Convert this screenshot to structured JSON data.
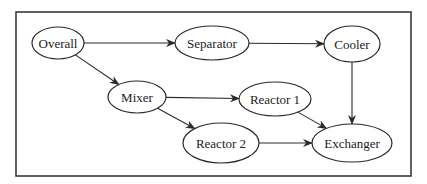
{
  "diagram": {
    "type": "flow-graph",
    "frame": {
      "x": 16,
      "y": 12,
      "width": 395,
      "height": 164
    },
    "nodes": [
      {
        "id": "overall",
        "label": "Overall",
        "cx": 58,
        "cy": 43,
        "rx": 26,
        "ry": 16
      },
      {
        "id": "separator",
        "label": "Separator",
        "cx": 212,
        "cy": 43,
        "rx": 37,
        "ry": 17
      },
      {
        "id": "cooler",
        "label": "Cooler",
        "cx": 352,
        "cy": 44,
        "rx": 28,
        "ry": 18
      },
      {
        "id": "mixer",
        "label": "Mixer",
        "cx": 137,
        "cy": 97,
        "rx": 29,
        "ry": 16
      },
      {
        "id": "reactor1",
        "label": "Reactor 1",
        "cx": 275,
        "cy": 99,
        "rx": 36,
        "ry": 17
      },
      {
        "id": "reactor2",
        "label": "Reactor 2",
        "cx": 221,
        "cy": 143,
        "rx": 38,
        "ry": 20
      },
      {
        "id": "exchanger",
        "label": "Exchanger",
        "cx": 352,
        "cy": 143,
        "rx": 40,
        "ry": 19
      }
    ],
    "edges": [
      {
        "from": "overall",
        "to": "separator"
      },
      {
        "from": "separator",
        "to": "cooler"
      },
      {
        "from": "overall",
        "to": "mixer"
      },
      {
        "from": "mixer",
        "to": "reactor1"
      },
      {
        "from": "mixer",
        "to": "reactor2"
      },
      {
        "from": "reactor1",
        "to": "exchanger"
      },
      {
        "from": "cooler",
        "to": "exchanger"
      },
      {
        "from": "reactor2",
        "to": "exchanger"
      }
    ],
    "colors": {
      "stroke": "#2a2a2a",
      "text": "#222222",
      "background": "#ffffff"
    }
  }
}
